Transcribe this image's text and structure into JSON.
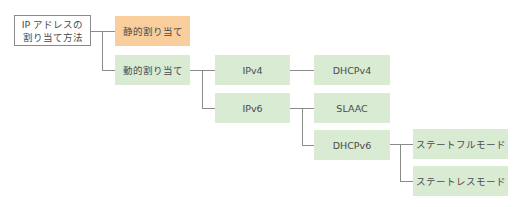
{
  "diagram": {
    "type": "tree",
    "colors": {
      "static": "#f9cd9c",
      "dynamic": "#d9ebd3",
      "root_border": "#8a8a8a",
      "connector": "#8a8a8a",
      "text": "#4a4a4a"
    },
    "nodes": {
      "root": {
        "line1": "IP アドレスの",
        "line2": "割り当て方法"
      },
      "static": {
        "label": "静的割り当て"
      },
      "dynamic": {
        "label": "動的割り当て"
      },
      "ipv4": {
        "label": "IPv4"
      },
      "ipv6": {
        "label": "IPv6"
      },
      "dhcpv4": {
        "label": "DHCPv4"
      },
      "slaac": {
        "label": "SLAAC"
      },
      "dhcpv6": {
        "label": "DHCPv6"
      },
      "stateful": {
        "label": "ステートフルモード"
      },
      "stateless": {
        "label": "ステートレスモード"
      }
    },
    "edges": [
      [
        "root",
        "static"
      ],
      [
        "root",
        "dynamic"
      ],
      [
        "dynamic",
        "ipv4"
      ],
      [
        "dynamic",
        "ipv6"
      ],
      [
        "ipv4",
        "dhcpv4"
      ],
      [
        "ipv6",
        "slaac"
      ],
      [
        "ipv6",
        "dhcpv6"
      ],
      [
        "dhcpv6",
        "stateful"
      ],
      [
        "dhcpv6",
        "stateless"
      ]
    ]
  }
}
